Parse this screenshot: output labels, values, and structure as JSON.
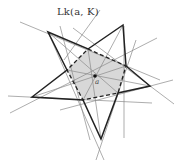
{
  "figure": {
    "link_label": "Lk(a, K)",
    "center_label": "a",
    "colors": {
      "star_stroke": "#222222",
      "thin_lines": "#888888",
      "fill": "#d6d6d6",
      "dashed_stroke": "#222222"
    },
    "star_vertices": [
      [
        48,
        32
      ],
      [
        123,
        25
      ],
      [
        150,
        86
      ],
      [
        101,
        139
      ],
      [
        32,
        97
      ]
    ],
    "link_pentagon": [
      [
        88,
        49
      ],
      [
        126,
        66
      ],
      [
        118,
        93
      ],
      [
        83,
        100
      ],
      [
        67,
        70
      ]
    ],
    "center": [
      95,
      76
    ]
  }
}
